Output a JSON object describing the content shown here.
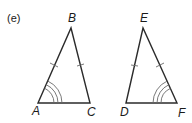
{
  "part_label": "(e)",
  "triangles": [
    {
      "name": "ABC",
      "vertices": {
        "A": "A",
        "B": "B",
        "C": "C"
      },
      "equal_sides": [
        "AB",
        "BC"
      ],
      "marked_angle": "A",
      "angle_mark": "triple arc",
      "side_mark": "single tick"
    },
    {
      "name": "DEF",
      "vertices": {
        "D": "D",
        "E": "E",
        "F": "F"
      },
      "equal_sides": [
        "DE",
        "EF"
      ],
      "marked_angle": "F",
      "angle_mark": "triple arc",
      "side_mark": "single tick"
    }
  ],
  "colors": {
    "line": "#2b2b2b",
    "marks": "#6a6a6a",
    "text": "#1a1a1a"
  }
}
